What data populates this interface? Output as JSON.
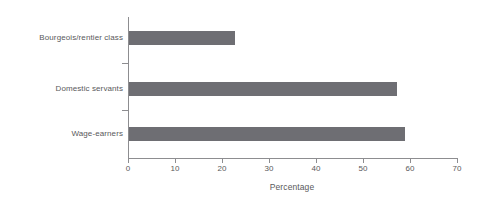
{
  "chart_data": {
    "type": "bar",
    "orientation": "horizontal",
    "title": "",
    "subtitle": "",
    "categories": [
      "Bourgeois/rentier class",
      "Domestic servants",
      "Wage-earners"
    ],
    "values": [
      22.5,
      57.0,
      58.7
    ],
    "series": [
      {
        "name": "Percentage",
        "values": [
          22.5,
          57.0,
          58.7
        ]
      }
    ],
    "xlabel": "Percentage",
    "ylabel": "",
    "xlim": [
      0,
      70
    ],
    "ylim": [
      0,
      3
    ],
    "xticks": [
      0,
      10,
      20,
      30,
      40,
      50,
      60,
      70
    ],
    "xtick_labels": [
      "0",
      "10",
      "20",
      "30",
      "40",
      "50",
      "60",
      "70"
    ],
    "grid": false,
    "legend": false,
    "legend_position": "none",
    "bar_color": "#6e6e73",
    "axis_color": "#8d8d90",
    "text_color": "#59595b",
    "background_color": "#ffffff",
    "annotations": []
  },
  "axis": {
    "x_title": "Percentage"
  },
  "labels": {
    "category_0": "Bourgeois/rentier class",
    "category_1": "Domestic servants",
    "category_2": "Wage-earners"
  },
  "ticks": {
    "t0": "0",
    "t1": "10",
    "t2": "20",
    "t3": "30",
    "t4": "40",
    "t5": "50",
    "t6": "60",
    "t7": "70"
  }
}
